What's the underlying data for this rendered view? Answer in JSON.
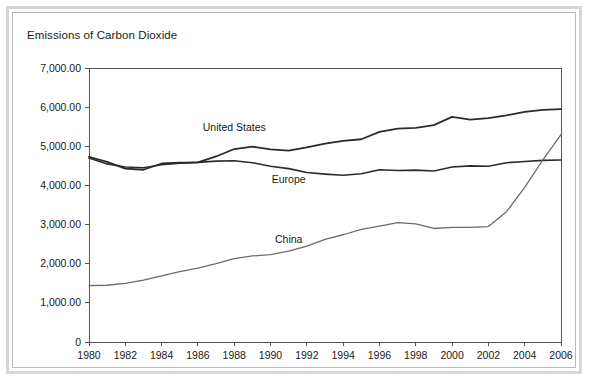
{
  "chart_data": {
    "type": "line",
    "title": "Emissions of Carbon Dioxide",
    "xlabel": "",
    "ylabel": "",
    "xlim": [
      1980,
      2006
    ],
    "ylim": [
      0,
      7000
    ],
    "grid": false,
    "legend_position": "inline-labels",
    "y_ticks": [
      "0",
      "1,000.00",
      "2,000.00",
      "3,000.00",
      "4,000.00",
      "5,000.00",
      "6,000.00",
      "7,000.00"
    ],
    "y_tick_values": [
      0,
      1000,
      2000,
      3000,
      4000,
      5000,
      6000,
      7000
    ],
    "x_ticks": [
      "1980",
      "1982",
      "1984",
      "1986",
      "1988",
      "1990",
      "1992",
      "1994",
      "1996",
      "1998",
      "2000",
      "2002",
      "2004",
      "2006"
    ],
    "x_tick_values": [
      1980,
      1982,
      1984,
      1986,
      1988,
      1990,
      1992,
      1994,
      1996,
      1998,
      2000,
      2002,
      2004,
      2006
    ],
    "x": [
      1980,
      1981,
      1982,
      1983,
      1984,
      1985,
      1986,
      1987,
      1988,
      1989,
      1990,
      1991,
      1992,
      1993,
      1994,
      1995,
      1996,
      1997,
      1998,
      1999,
      2000,
      2001,
      2002,
      2003,
      2004,
      2005,
      2006
    ],
    "series": [
      {
        "name": "United States",
        "color": "#2b2b2b",
        "width": 1.8,
        "label_x": 1988,
        "label_y": 5380,
        "values": [
          4730,
          4600,
          4430,
          4400,
          4560,
          4580,
          4590,
          4740,
          4930,
          4990,
          4920,
          4890,
          4970,
          5070,
          5140,
          5180,
          5370,
          5450,
          5470,
          5540,
          5750,
          5680,
          5720,
          5790,
          5880,
          5930,
          5950
        ]
      },
      {
        "name": "Europe",
        "color": "#2b2b2b",
        "width": 1.6,
        "label_x": 1991,
        "label_y": 4060,
        "values": [
          4700,
          4550,
          4470,
          4450,
          4530,
          4570,
          4590,
          4620,
          4630,
          4580,
          4490,
          4430,
          4330,
          4290,
          4260,
          4300,
          4400,
          4380,
          4390,
          4370,
          4470,
          4500,
          4490,
          4580,
          4610,
          4640,
          4650
        ]
      },
      {
        "name": "China",
        "color": "#6b6b6b",
        "width": 1.3,
        "label_x": 1991,
        "label_y": 2530,
        "values": [
          1440,
          1450,
          1500,
          1580,
          1690,
          1800,
          1890,
          2000,
          2130,
          2200,
          2230,
          2320,
          2450,
          2620,
          2740,
          2880,
          2960,
          3050,
          3020,
          2900,
          2930,
          2930,
          2950,
          3330,
          3950,
          4650,
          5300
        ]
      }
    ]
  }
}
